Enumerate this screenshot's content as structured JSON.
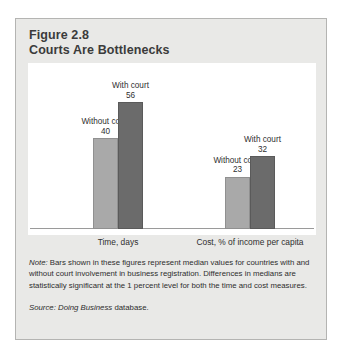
{
  "figure": {
    "number": "Figure 2.8",
    "title": "Courts Are Bottlenecks",
    "panel_color": "#e9e9e7",
    "title_color": "#3b3b3b"
  },
  "note": {
    "lead": "Note:",
    "text": " Bars shown in these figures represent median values for countries with and without court involvement in business registration. Differences in medians are statistically significant at the 1 percent level for both the time and cost measures."
  },
  "source": {
    "lead": "Source:",
    "work": " Doing Business",
    "tail": " database."
  },
  "chart_data": {
    "type": "bar",
    "title": "Courts Are Bottlenecks",
    "xlabel": "",
    "ylabel": "",
    "categories": [
      "Time, days",
      "Cost, % of income per capita"
    ],
    "series": [
      {
        "name": "Without court",
        "values": [
          40,
          23
        ],
        "color": "#a9a9a9"
      },
      {
        "name": "With court",
        "values": [
          56,
          32
        ],
        "color": "#6b6b6b"
      }
    ],
    "ylim": [
      0,
      60
    ],
    "grid": false,
    "legend": "inline-data-labels",
    "annotations": [
      {
        "label": "Without court",
        "value": 40,
        "category": "Time, days"
      },
      {
        "label": "With court",
        "value": 56,
        "category": "Time, days"
      },
      {
        "label": "Without court",
        "value": 23,
        "category": "Cost, % of income per capita"
      },
      {
        "label": "With court",
        "value": 32,
        "category": "Cost, % of income per capita"
      }
    ]
  }
}
